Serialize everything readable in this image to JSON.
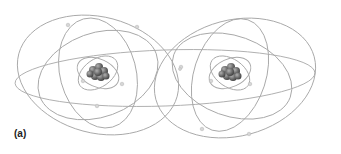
{
  "figure": {
    "label": "(a)",
    "colors": {
      "orbit": "#a8a8a8",
      "nucleus": "#6e6e6e",
      "electron": "#d6d6d6",
      "background": "#ffffff"
    },
    "atoms": [
      {
        "name": "left-atom",
        "nucleus_center": [
          98,
          73
        ]
      },
      {
        "name": "right-atom",
        "nucleus_center": [
          230,
          73
        ]
      }
    ]
  }
}
